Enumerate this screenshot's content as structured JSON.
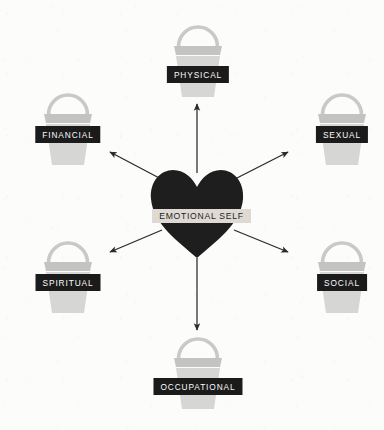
{
  "diagram": {
    "background_color": "#fcfcfb",
    "center": {
      "label": "EMOTIONAL SELF",
      "shape": "heart",
      "fill_color": "#1e1e1e",
      "band_color": "#dedad3",
      "band_text_color": "#1c1c1c"
    },
    "label_style": {
      "background_color": "#1b1b1b",
      "text_color": "#fbfbfb"
    },
    "bucket_style": {
      "handle_color": "#c9c9c7",
      "rim_color": "#c3c3c1",
      "body_color": "#d6d6d4"
    },
    "arrow_color": "#2a2a2a",
    "nodes": [
      {
        "id": "physical",
        "label": "PHYSICAL",
        "icon": "bucket-icon",
        "position": "top"
      },
      {
        "id": "sexual",
        "label": "SEXUAL",
        "icon": "bucket-icon",
        "position": "upper-right"
      },
      {
        "id": "social",
        "label": "SOCIAL",
        "icon": "bucket-icon",
        "position": "lower-right"
      },
      {
        "id": "occupational",
        "label": "OCCUPATIONAL",
        "icon": "bucket-icon",
        "position": "bottom"
      },
      {
        "id": "spiritual",
        "label": "SPIRITUAL",
        "icon": "bucket-icon",
        "position": "lower-left"
      },
      {
        "id": "financial",
        "label": "FINANCIAL",
        "icon": "bucket-icon",
        "position": "upper-left"
      }
    ]
  }
}
